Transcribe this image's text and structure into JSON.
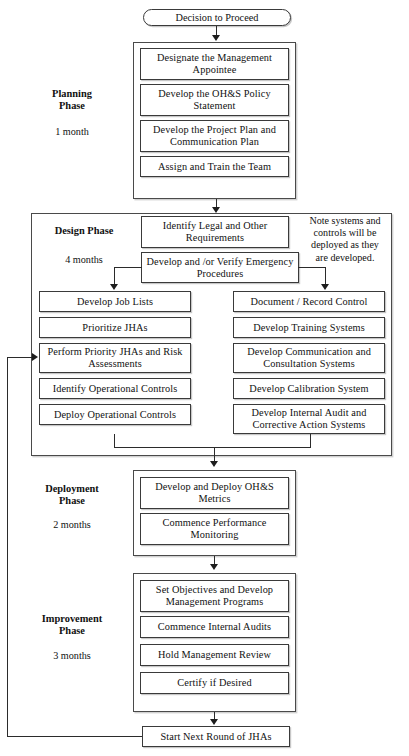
{
  "diagram": {
    "start": {
      "label": "Decision to Proceed",
      "shape": "stadium"
    },
    "phases": [
      {
        "id": "planning",
        "name": "Planning\nPhase",
        "name_line1": "Planning",
        "name_line2": "Phase",
        "duration": "1 month",
        "steps": [
          "Designate the Management Appointee",
          "Develop the OH&S Policy Statement",
          "Develop the Project Plan and Communication Plan",
          "Assign and Train the Team"
        ]
      },
      {
        "id": "design",
        "name": "Design Phase",
        "name_line1": "Design Phase",
        "name_line2": "",
        "duration": "4 months",
        "note": "Note systems and controls will be deployed as they are developed.",
        "note_lines": [
          "Note systems and",
          "controls will be",
          "deployed as they",
          "are developed."
        ],
        "header_steps": [
          "Identify Legal and Other Requirements",
          "Develop and /or Verify Emergency Procedures"
        ],
        "left_column": [
          "Develop Job Lists",
          "Prioritize JHAs",
          "Perform Priority JHAs and Risk Assessments",
          "Identify Operational Controls",
          "Deploy Operational Controls"
        ],
        "right_column": [
          "Document / Record Control",
          "Develop Training Systems",
          "Develop Communication and Consultation Systems",
          "Develop Calibration System",
          "Develop Internal Audit and Corrective Action Systems"
        ]
      },
      {
        "id": "deployment",
        "name": "Deployment\nPhase",
        "name_line1": "Deployment",
        "name_line2": "Phase",
        "duration": "2 months",
        "steps": [
          "Develop and Deploy OH&S Metrics",
          "Commence Performance Monitoring"
        ]
      },
      {
        "id": "improvement",
        "name": "Improvement\nPhase",
        "name_line1": "Improvement",
        "name_line2": "Phase",
        "duration": "3 months",
        "steps": [
          "Set Objectives and Develop Management Programs",
          "Commence Internal Audits",
          "Hold Management Review",
          "Certify if Desired"
        ]
      }
    ],
    "end": {
      "label": "Start Next Round of JHAs",
      "shape": "rectangle",
      "feedback_target": "Perform Priority JHAs and Risk Assessments"
    },
    "colors": {
      "box_border": "#3a3a3a",
      "container_border": "#4a4a4a",
      "connector": "#2b2b2b",
      "background": "#ffffff",
      "text": "#111111"
    }
  }
}
